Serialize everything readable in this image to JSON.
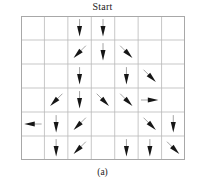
{
  "figure": {
    "title": "Start",
    "caption": "(a)",
    "grid": {
      "columns": 7,
      "rows": 6,
      "line_color": "#b9b9b9",
      "border_color": "#a8a8a8",
      "background_color": "#ffffff",
      "x": 21,
      "y": 16,
      "width": 164,
      "height": 144,
      "cell_width": 23.43,
      "cell_height": 24.0
    },
    "arrow": {
      "color": "#161616",
      "shaft_color": "#9a9a9a",
      "length": 17
    }
  },
  "chart_data": {
    "type": "scatter",
    "title": "Start",
    "subtitle": "(a)",
    "xlabel": "",
    "ylabel": "",
    "grid": true,
    "legend": "none",
    "xlim": [
      0,
      7
    ],
    "ylim": [
      0,
      6
    ],
    "direction_codes": {
      "down": 270,
      "left": 180,
      "right": 0,
      "down-left": 225,
      "down-right": 315,
      "up-left": 135,
      "up-right": 45
    },
    "arrows": [
      {
        "row": 1,
        "col": 3,
        "direction": "down",
        "angle_deg": 270
      },
      {
        "row": 1,
        "col": 4,
        "direction": "down",
        "angle_deg": 270
      },
      {
        "row": 2,
        "col": 3,
        "direction": "down-left",
        "angle_deg": 225
      },
      {
        "row": 2,
        "col": 4,
        "direction": "down",
        "angle_deg": 270
      },
      {
        "row": 2,
        "col": 5,
        "direction": "down-right",
        "angle_deg": 315
      },
      {
        "row": 3,
        "col": 3,
        "direction": "down",
        "angle_deg": 270
      },
      {
        "row": 3,
        "col": 5,
        "direction": "down",
        "angle_deg": 270
      },
      {
        "row": 3,
        "col": 6,
        "direction": "down-right",
        "angle_deg": 315
      },
      {
        "row": 4,
        "col": 2,
        "direction": "down-left",
        "angle_deg": 225
      },
      {
        "row": 4,
        "col": 3,
        "direction": "down",
        "angle_deg": 270
      },
      {
        "row": 4,
        "col": 4,
        "direction": "down-right",
        "angle_deg": 315
      },
      {
        "row": 4,
        "col": 5,
        "direction": "down-right",
        "angle_deg": 315
      },
      {
        "row": 4,
        "col": 6,
        "direction": "right",
        "angle_deg": 0
      },
      {
        "row": 5,
        "col": 1,
        "direction": "left",
        "angle_deg": 180
      },
      {
        "row": 5,
        "col": 2,
        "direction": "down",
        "angle_deg": 270
      },
      {
        "row": 5,
        "col": 3,
        "direction": "down-left",
        "angle_deg": 225
      },
      {
        "row": 5,
        "col": 6,
        "direction": "down-right",
        "angle_deg": 315
      },
      {
        "row": 5,
        "col": 7,
        "direction": "down",
        "angle_deg": 270
      },
      {
        "row": 6,
        "col": 2,
        "direction": "down",
        "angle_deg": 270
      },
      {
        "row": 6,
        "col": 3,
        "direction": "down-left",
        "angle_deg": 225
      },
      {
        "row": 6,
        "col": 5,
        "direction": "down",
        "angle_deg": 270
      },
      {
        "row": 6,
        "col": 6,
        "direction": "down",
        "angle_deg": 270
      },
      {
        "row": 6,
        "col": 7,
        "direction": "down-right",
        "angle_deg": 315
      }
    ]
  }
}
